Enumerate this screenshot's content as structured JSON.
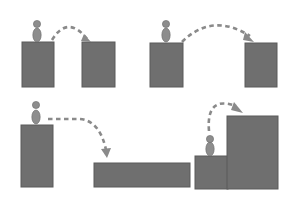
{
  "colors": {
    "background": "#ffffff",
    "block_fill": "#6f6f6f",
    "block_stroke": "#5a5a5a",
    "figure_fill": "#8d8d8d",
    "figure_stroke": "#6a6a6a",
    "arrow": "#8a8a8a"
  },
  "panels": [
    {
      "name": "panel-jump-across-gap-near",
      "blocks": [
        {
          "x": 22,
          "y": 42,
          "w": 32,
          "h": 45
        },
        {
          "x": 82,
          "y": 42,
          "w": 33,
          "h": 45
        }
      ],
      "figure": {
        "cx": 37,
        "head_cy": 24,
        "body_cy": 35
      },
      "arrow": {
        "path": "M52,40 Q68,14 88,40",
        "head": "84,34 91,42 81,41"
      }
    },
    {
      "name": "panel-jump-across-gap-far",
      "blocks": [
        {
          "x": 150,
          "y": 43,
          "w": 33,
          "h": 44
        },
        {
          "x": 245,
          "y": 43,
          "w": 32,
          "h": 44
        }
      ],
      "figure": {
        "cx": 166,
        "head_cy": 24,
        "body_cy": 35
      },
      "arrow": {
        "path": "M182,42 Q212,12 250,36",
        "head": "245,32 254,42 243,40"
      }
    },
    {
      "name": "panel-drop-to-lower-platform",
      "blocks": [
        {
          "x": 21,
          "y": 125,
          "w": 32,
          "h": 62
        },
        {
          "x": 94,
          "y": 163,
          "w": 96,
          "h": 24
        }
      ],
      "figure": {
        "cx": 36,
        "head_cy": 105,
        "body_cy": 117
      },
      "arrow": {
        "path": "M48,119 L80,119 Q100,121 106,150",
        "head": "101,149 107,158 111,148"
      }
    },
    {
      "name": "panel-climb-to-higher-platform",
      "blocks": [
        {
          "x": 195,
          "y": 156,
          "w": 33,
          "h": 33
        },
        {
          "x": 227,
          "y": 116,
          "w": 51,
          "h": 73
        }
      ],
      "figure": {
        "cx": 210,
        "head_cy": 139,
        "body_cy": 149
      },
      "arrow": {
        "path": "M209,131 Q206,95 236,106",
        "head": "234,102 243,113 231,110"
      }
    }
  ]
}
